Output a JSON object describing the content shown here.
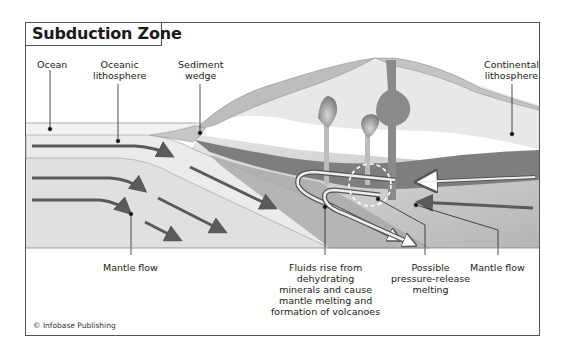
{
  "title": "Subduction Zone",
  "labels": {
    "ocean": [
      "Ocean"
    ],
    "oceanic_lithosphere": [
      "Oceanic",
      "lithosphere"
    ],
    "sediment_wedge": [
      "Sediment",
      "wedge"
    ],
    "continental_lithosphere": [
      "Continental",
      "lithosphere"
    ],
    "mantle_flow_left": [
      "Mantle flow"
    ],
    "fluids_rise": [
      "Fluids rise from",
      "dehydrating",
      "minerals and cause",
      "mantle melting and",
      "formation of volcanoes"
    ],
    "pressure_release": [
      "Possible",
      "pressure-release",
      "melting"
    ],
    "mantle_flow_right": [
      "Mantle flow"
    ]
  },
  "credit": "© Infobase Publishing",
  "colors": {
    "frame": "#555555",
    "ocean": "#f2f2f2",
    "oceanic_lithosphere": "#e6e6e6",
    "mantle": "#dcdcdc",
    "continental_crust": "#bdbdbd",
    "continental_lithosphere": "#e8e8e8",
    "dark_band": "#7a7a7a",
    "arrows": "#5a5a5a",
    "magma": "#8a8a8a"
  }
}
